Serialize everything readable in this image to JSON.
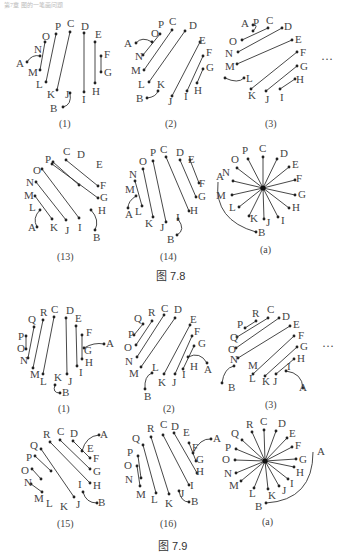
{
  "header": {
    "text": "第7章 图的一笔画问题"
  },
  "figures": [
    {
      "id": "fig-7-8",
      "caption": "图 7.8",
      "panels": [
        {
          "label": "(1)"
        },
        {
          "label": "(2)"
        },
        {
          "label": "(3)"
        },
        {
          "label": "(13)"
        },
        {
          "label": "(14)"
        },
        {
          "label": "(a)"
        }
      ],
      "ellipsis": "···"
    },
    {
      "id": "fig-7-9",
      "caption": "图 7.9",
      "panels": [
        {
          "label": "(1)"
        },
        {
          "label": "(2)"
        },
        {
          "label": "(3)"
        },
        {
          "label": "(15)"
        },
        {
          "label": "(16)"
        },
        {
          "label": "(a)"
        }
      ],
      "ellipsis": "···"
    }
  ]
}
